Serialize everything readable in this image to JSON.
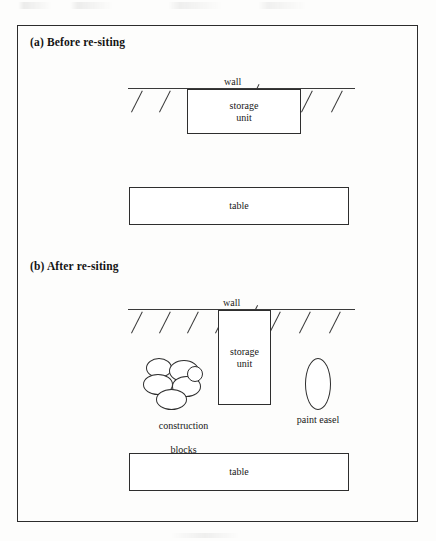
{
  "figure": {
    "frame_color": "#2c2c2c",
    "background_color": "#ffffff",
    "ink_color": "#2e2e2e"
  },
  "panels": [
    {
      "id": "a",
      "title": "(a) Before re-siting",
      "wall": {
        "label": "wall",
        "hatch_count": 8
      },
      "shapes": [
        {
          "name": "storage-unit",
          "label": "storage\nunit",
          "line1": "storage",
          "line2": "unit",
          "orientation": "horizontal"
        },
        {
          "name": "table",
          "label": "table",
          "line1": "table",
          "orientation": "horizontal"
        }
      ]
    },
    {
      "id": "b",
      "title": "(b) After re-siting",
      "wall": {
        "label": "wall",
        "hatch_count": 8
      },
      "shapes": [
        {
          "name": "construction-blocks",
          "label": "construction\nblocks",
          "line1": "construction",
          "line2": "blocks",
          "ellipse_count": 6
        },
        {
          "name": "storage-unit",
          "label": "storage\nunit",
          "line1": "storage",
          "line2": "unit",
          "orientation": "vertical"
        },
        {
          "name": "paint-easel",
          "label": "paint easel",
          "line1": "paint easel",
          "shape": "ellipse"
        },
        {
          "name": "table",
          "label": "table",
          "line1": "table",
          "orientation": "horizontal"
        }
      ]
    }
  ]
}
